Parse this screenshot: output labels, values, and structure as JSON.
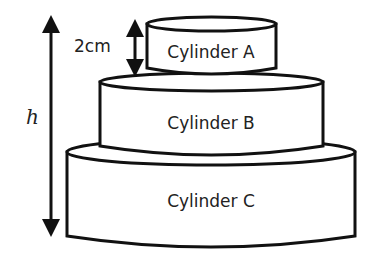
{
  "diagram": {
    "cylinders": [
      {
        "id": "A",
        "label": "Cylinder A"
      },
      {
        "id": "B",
        "label": "Cylinder B"
      },
      {
        "id": "C",
        "label": "Cylinder C"
      }
    ],
    "dimensions": {
      "gap_label": "2cm",
      "height_label": "h"
    },
    "colors": {
      "stroke": "#111111",
      "fill": "#ffffff",
      "text": "#222222"
    }
  }
}
